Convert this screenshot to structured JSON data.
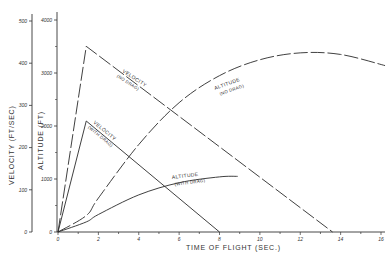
{
  "chart_data": {
    "type": "line",
    "title": "",
    "xlabel": "TIME OF FLIGHT (SEC.)",
    "ylabel_left": "VELOCITY (FT/SEC)",
    "ylabel_right": "ALTITUDE (FT)",
    "x_ticks": [
      "0",
      "2",
      "4",
      "6",
      "8",
      "10",
      "12",
      "14",
      "16"
    ],
    "velocity_ticks": [
      "0",
      "100",
      "200",
      "300",
      "400",
      "500"
    ],
    "altitude_ticks": [
      "0",
      "1000",
      "2000",
      "3000",
      "4000"
    ],
    "xlim": [
      0,
      16
    ],
    "velocity_lim": [
      0,
      500
    ],
    "altitude_lim": [
      0,
      4000
    ],
    "grid": false,
    "legend": "inline labels",
    "series": [
      {
        "name": "VELOCITY (NO DRAG)",
        "axis": "velocity",
        "style": "long-dash",
        "x": [
          0,
          1.4,
          13.6
        ],
        "y": [
          0,
          440,
          0
        ]
      },
      {
        "name": "VELOCITY (WITH DRAG)",
        "axis": "velocity",
        "style": "solid",
        "x": [
          0,
          1.4,
          8.0
        ],
        "y": [
          0,
          263,
          0
        ]
      },
      {
        "name": "ALTITUDE (NO DRAG)",
        "axis": "altitude",
        "style": "long-dash",
        "x": [
          0,
          1.4,
          2,
          4,
          6,
          8,
          10,
          12,
          14,
          16.2
        ],
        "y": [
          0,
          310,
          640,
          1650,
          2440,
          2950,
          3250,
          3380,
          3350,
          3140
        ]
      },
      {
        "name": "ALTITUDE (WITH DRAG)",
        "axis": "altitude",
        "style": "solid",
        "x": [
          0,
          1.4,
          2,
          4,
          6,
          8,
          8.9
        ],
        "y": [
          0,
          190,
          330,
          700,
          930,
          1040,
          1050
        ]
      }
    ]
  },
  "labels": {
    "velocity_no_drag": "VELOCITY",
    "velocity_no_drag_sub": "(NO DRAG)",
    "velocity_with_drag": "VELOCITY",
    "velocity_with_drag_sub": "(WITH DRAG)",
    "altitude_no_drag": "ALTITUDE",
    "altitude_no_drag_sub": "(NO DRAG)",
    "altitude_with_drag": "ALTITUDE",
    "altitude_with_drag_sub": "(WITH DRAG)"
  }
}
